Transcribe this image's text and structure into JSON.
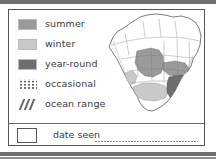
{
  "card": {
    "legend": {
      "entries": [
        {
          "label": "summer",
          "symbol": "solid-swatch",
          "color": "#9a9a9a"
        },
        {
          "label": "winter",
          "symbol": "solid-swatch",
          "color": "#c9c9c9"
        },
        {
          "label": "year-round",
          "symbol": "solid-swatch",
          "color": "#6e6e6e"
        },
        {
          "label": "occasional",
          "symbol": "dotted-pattern",
          "color": "#5d5d5d"
        },
        {
          "label": "ocean range",
          "symbol": "diagonal-hatch",
          "color": "#6b6b6b"
        }
      ]
    },
    "date_seen": {
      "label": "date seen",
      "value": "",
      "checkbox_checked": false
    },
    "map": {
      "region": "North America",
      "outline_color": "#5a5a5a",
      "ocean_color": "#ffffff",
      "land_color": "#ffffff",
      "ranges": [
        {
          "type": "summer",
          "color": "#9a9a9a",
          "area": "northern plains and prairies"
        },
        {
          "type": "winter",
          "color": "#c9c9c9",
          "area": "southern and southwestern states"
        },
        {
          "type": "year-round",
          "color": "#6e6e6e",
          "area": "southeastern states"
        }
      ]
    }
  }
}
